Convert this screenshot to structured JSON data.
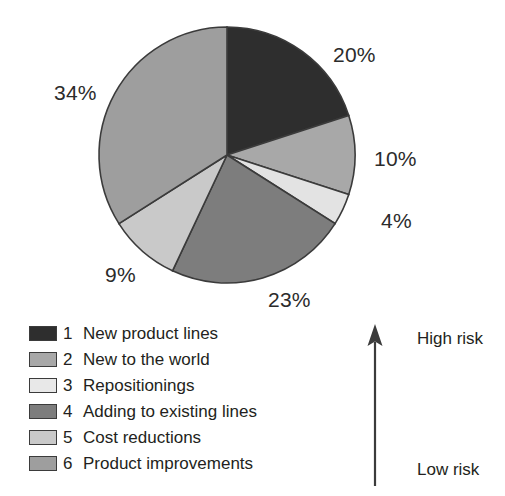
{
  "chart_data": {
    "type": "pie",
    "title": "",
    "categories": [
      "New product lines",
      "New to the world",
      "Repositionings",
      "Adding to existing lines",
      "Cost reductions",
      "Product improvements"
    ],
    "values": [
      20,
      10,
      4,
      23,
      9,
      34
    ],
    "value_labels": [
      "20%",
      "10%",
      "4%",
      "23%",
      "9%",
      "34%"
    ],
    "units": "percent",
    "start_angle_deg": 0,
    "direction": "clockwise",
    "legend_position": "bottom-left",
    "grid": false,
    "colors": [
      "#2e2e2e",
      "#a8a8a8",
      "#e3e3e3",
      "#7d7d7d",
      "#c9c9c9",
      "#9e9e9e"
    ],
    "slice_border_color": "#3b3b3b",
    "annotations": [
      "High risk",
      "Low risk"
    ]
  },
  "pie": {
    "labels": [
      {
        "text": "20%",
        "slice": 1
      },
      {
        "text": "10%",
        "slice": 2
      },
      {
        "text": "4%",
        "slice": 3
      },
      {
        "text": "23%",
        "slice": 4
      },
      {
        "text": "9%",
        "slice": 5
      },
      {
        "text": "34%",
        "slice": 6
      }
    ]
  },
  "legend": {
    "items": [
      {
        "number": "1",
        "label": "New product lines",
        "color": "#2e2e2e"
      },
      {
        "number": "2",
        "label": "New to the world",
        "color": "#a8a8a8"
      },
      {
        "number": "3",
        "label": "Repositionings",
        "color": "#e8e8e8"
      },
      {
        "number": "4",
        "label": "Adding to existing lines",
        "color": "#7d7d7d"
      },
      {
        "number": "5",
        "label": "Cost reductions",
        "color": "#c9c9c9"
      },
      {
        "number": "6",
        "label": "Product improvements",
        "color": "#9e9e9e"
      }
    ]
  },
  "risk_axis": {
    "high_label": "High risk",
    "low_label": "Low risk",
    "direction": "up"
  }
}
